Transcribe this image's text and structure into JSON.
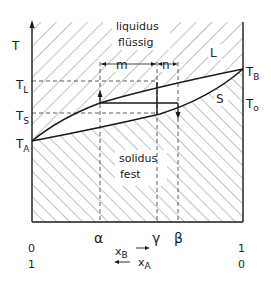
{
  "diagram": {
    "type": "binary-phase-diagram",
    "axis": {
      "y_label": "T",
      "x_label_B": "x",
      "x_label_B_sub": "B",
      "x_label_A": "x",
      "x_label_A_sub": "A",
      "x_left_B": "0",
      "x_right_B": "1",
      "x_left_A": "1",
      "x_right_A": "0"
    },
    "temperatures": {
      "T_A": {
        "main": "T",
        "sub": "A"
      },
      "T_B": {
        "main": "T",
        "sub": "B"
      },
      "T_L": {
        "main": "T",
        "sub": "L"
      },
      "T_S": {
        "main": "T",
        "sub": "S"
      },
      "T_0": {
        "main": "T",
        "sub": "o"
      }
    },
    "regions": {
      "liquid_line1": "liquidus",
      "liquid_line2": "flüssig",
      "solid_line1": "solidus",
      "solid_line2": "fest"
    },
    "curves": {
      "liquidus_label": "L",
      "solidus_label": "S"
    },
    "compositions": {
      "alpha": "α",
      "gamma": "γ",
      "beta": "β"
    },
    "lever": {
      "m": "m",
      "n": "n"
    },
    "colors": {
      "line": "#1a1a1a",
      "hatch": "#555555",
      "background": "#ffffff"
    }
  }
}
